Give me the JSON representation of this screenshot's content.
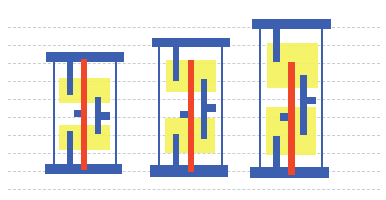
{
  "diagram": {
    "title": "",
    "colors": {
      "rail": "#3d5fb0",
      "diffusion": "#f4f25a",
      "gate": "#f0462a",
      "grid": "#c9ccd6",
      "background": "#ffffff"
    },
    "grid_lines_y": [
      27,
      45,
      63,
      81,
      99,
      117,
      135,
      153,
      171,
      189
    ],
    "cells": [
      {
        "name": "cell-1",
        "top_rail": [
          46,
          52,
          78,
          10
        ],
        "bottom_rail": [
          45,
          164,
          77,
          10
        ],
        "side_left": [
          53,
          62,
          2,
          102
        ],
        "side_right": [
          115,
          62,
          2,
          102
        ],
        "diff_top": [
          59,
          78,
          51,
          25
        ],
        "diff_bottom": [
          59,
          125,
          51,
          25
        ],
        "gate": [
          81,
          59,
          6,
          111
        ],
        "stub_top": [
          67,
          62,
          6,
          33
        ],
        "stub_bottom": [
          67,
          131,
          6,
          39
        ],
        "nub_left": [
          74,
          110,
          7,
          7
        ],
        "vert_right": [
          95,
          97,
          6,
          37
        ],
        "nub_right": [
          101,
          112,
          9,
          8
        ]
      },
      {
        "name": "cell-2",
        "top_rail": [
          152,
          38,
          78,
          9
        ],
        "bottom_rail": [
          150,
          165,
          78,
          12
        ],
        "side_left": [
          158,
          47,
          2,
          118
        ],
        "side_right": [
          221,
          47,
          2,
          118
        ],
        "diff_top": [
          166,
          60,
          50,
          32
        ],
        "diff_bottom": [
          165,
          118,
          50,
          35
        ],
        "gate": [
          188,
          60,
          6,
          112
        ],
        "stub_top": [
          173,
          47,
          6,
          34
        ],
        "stub_bottom": [
          173,
          134,
          6,
          33
        ],
        "nub_left": [
          180,
          111,
          8,
          7
        ],
        "vert_right": [
          201,
          79,
          6,
          60
        ],
        "nub_right": [
          207,
          104,
          9,
          8
        ]
      },
      {
        "name": "cell-3",
        "top_rail": [
          252,
          19,
          79,
          10
        ],
        "bottom_rail": [
          250,
          167,
          79,
          11
        ],
        "side_left": [
          259,
          29,
          2,
          138
        ],
        "side_right": [
          321,
          29,
          2,
          138
        ],
        "diff_top": [
          267,
          43,
          51,
          45
        ],
        "diff_bottom": [
          266,
          107,
          50,
          48
        ],
        "gate": [
          288,
          62,
          7,
          113
        ],
        "stub_top": [
          273,
          29,
          7,
          33
        ],
        "stub_bottom": [
          273,
          136,
          7,
          36
        ],
        "nub_left": [
          280,
          113,
          8,
          8
        ],
        "vert_right": [
          300,
          75,
          7,
          60
        ],
        "nub_right": [
          307,
          97,
          9,
          7
        ]
      }
    ]
  }
}
